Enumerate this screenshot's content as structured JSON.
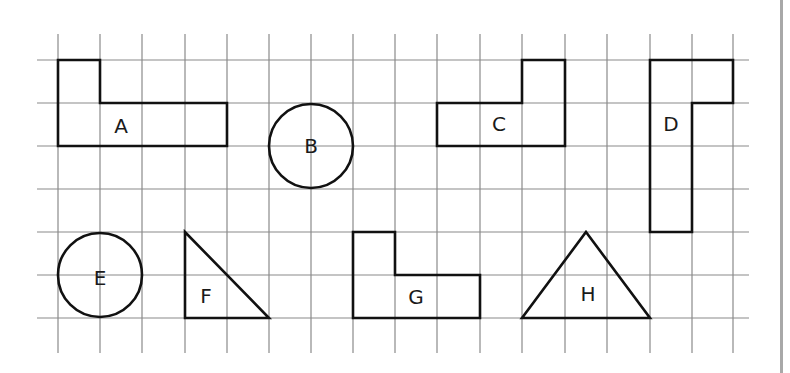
{
  "grid": {
    "x_lines": [
      58,
      100,
      142,
      185,
      227,
      269,
      311,
      353,
      395,
      437,
      480,
      522,
      565,
      607,
      650,
      692,
      733
    ],
    "y_lines": [
      60,
      103,
      146,
      189,
      232,
      275,
      318
    ],
    "v_top": 34,
    "v_bottom": 353,
    "h_left": 37,
    "h_right": 749,
    "line_color": "#8a8a8a"
  },
  "shapes": [
    {
      "label": "A",
      "type": "polygon",
      "points": "58,60 100,60 100,103 227,103 227,146 58,146",
      "label_pos": [
        121,
        126
      ]
    },
    {
      "label": "B",
      "type": "circle",
      "cx": 311,
      "cy": 146,
      "r": 42,
      "label_pos": [
        311,
        146
      ]
    },
    {
      "label": "C",
      "type": "polygon",
      "points": "437,103 522,103 522,60 565,60 565,146 437,146",
      "label_pos": [
        499,
        124
      ]
    },
    {
      "label": "D",
      "type": "polygon",
      "points": "650,60 733,60 733,103 692,103 692,232 650,232",
      "label_pos": [
        671,
        124
      ]
    },
    {
      "label": "E",
      "type": "circle",
      "cx": 100,
      "cy": 275,
      "r": 42,
      "label_pos": [
        100,
        278
      ]
    },
    {
      "label": "F",
      "type": "polygon",
      "points": "185,232 185,318 269,318",
      "label_pos": [
        206,
        296
      ]
    },
    {
      "label": "G",
      "type": "polygon",
      "points": "353,232 395,232 395,275 480,275 480,318 353,318",
      "label_pos": [
        416,
        297
      ]
    },
    {
      "label": "H",
      "type": "polygon",
      "points": "586,232 650,318 522,318",
      "label_pos": [
        588,
        294
      ]
    }
  ],
  "labels": {
    "A": "A",
    "B": "B",
    "C": "C",
    "D": "D",
    "E": "E",
    "F": "F",
    "G": "G",
    "H": "H"
  },
  "colors": {
    "outline": "#111111",
    "grid": "#8a8a8a",
    "border": "#a8a8a8",
    "background": "#ffffff"
  }
}
